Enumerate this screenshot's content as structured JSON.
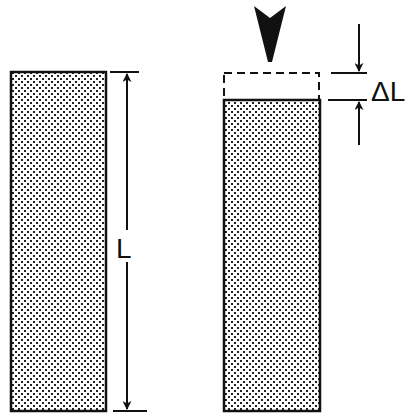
{
  "diagram": {
    "title": "",
    "labels": {
      "original_length": "L",
      "length_change": "ΔL"
    },
    "elements": {
      "original_column": "uncompressed column",
      "compressed_column": "compressed column",
      "original_outline": "original height outline (dashed)",
      "load_arrow": "applied load"
    },
    "colors": {
      "ink": "#111111",
      "background": "#ffffff"
    }
  }
}
